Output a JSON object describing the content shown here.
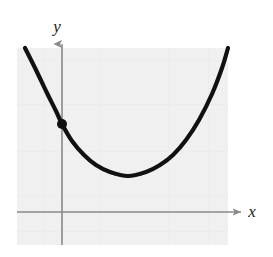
{
  "figure": {
    "width": 273,
    "height": 257,
    "background_color": "#ffffff",
    "plot_panel": {
      "name": "plot-background-panel",
      "fill_color": "#f0f0f0",
      "x": 17,
      "y": 48,
      "width": 211,
      "height": 197
    }
  },
  "axes": {
    "color": "#8a8a8a",
    "stroke_width": 1.6,
    "x_axis": {
      "label": "x",
      "y_pixel": 212,
      "x_start": 17,
      "x_end": 243,
      "arrow": "right"
    },
    "y_axis": {
      "label": "y",
      "x_pixel": 62,
      "y_start": 245,
      "y_end": 41,
      "arrow": "up"
    },
    "origin": {
      "x": 62,
      "y": 212
    }
  },
  "labels": {
    "x_label": "x",
    "x_label_pos": {
      "x": 252,
      "y": 217
    },
    "y_label": "y",
    "y_label_pos": {
      "x": 57,
      "y": 32
    }
  },
  "chart_data": {
    "type": "line",
    "title": "",
    "subtitle": "",
    "xlabel": "x",
    "ylabel": "y",
    "grid": false,
    "legend": null,
    "curve": {
      "name": "parabola",
      "shape": "upward-opening parabola",
      "color": "#111111",
      "stroke_width": 4.2,
      "pixel_points": [
        [
          25,
          48
        ],
        [
          36,
          70
        ],
        [
          47,
          93
        ],
        [
          56,
          111
        ],
        [
          62,
          124
        ],
        [
          72,
          141
        ],
        [
          84,
          155
        ],
        [
          96,
          165
        ],
        [
          110,
          172
        ],
        [
          128,
          176
        ],
        [
          146,
          172
        ],
        [
          160,
          165
        ],
        [
          173,
          155
        ],
        [
          186,
          140
        ],
        [
          199,
          120
        ],
        [
          212,
          94
        ],
        [
          222,
          68
        ],
        [
          228,
          48
        ]
      ],
      "vertex_pixel": [
        128,
        176
      ],
      "left_endpoint_pixel": [
        25,
        48
      ],
      "right_endpoint_pixel": [
        228,
        48
      ]
    },
    "points": [
      {
        "name": "y-intercept-point",
        "pixel": [
          62,
          124
        ],
        "radius": 5,
        "color": "#111111",
        "filled": true,
        "label": ""
      }
    ],
    "annotations": [],
    "xlim_pixel": [
      17,
      243
    ],
    "ylim_pixel": [
      245,
      41
    ],
    "tick_labels_x": [],
    "tick_labels_y": []
  }
}
